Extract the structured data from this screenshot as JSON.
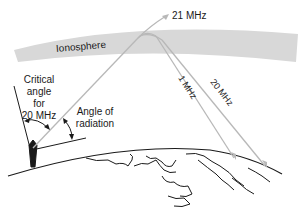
{
  "diagram": {
    "ionosphere_label": "Ionosphere",
    "freq_escape": "21 MHz",
    "freq_1": "1 MHz",
    "freq_20": "20 MHz",
    "critical_angle": {
      "line1": "Critical",
      "line2": "angle",
      "line3": "for",
      "line4": "20 MHz"
    },
    "radiation_angle": {
      "line1": "Angle of",
      "line2": "radiation"
    },
    "colors": {
      "ionosphere": "#d8d8d8",
      "ray": "#b8b8b8",
      "ink": "#1a1a1a"
    }
  }
}
